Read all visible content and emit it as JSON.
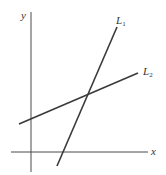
{
  "diagram": {
    "type": "coordinate-plane-two-lines",
    "axes": {
      "x_label": "x",
      "y_label": "y"
    },
    "lines": [
      {
        "name": "L1",
        "label_main": "L",
        "label_sub": "1",
        "slope_sign": "positive (steep)",
        "color": "#3a3a3a"
      },
      {
        "name": "L2",
        "label_main": "L",
        "label_sub": "2",
        "slope_sign": "positive (shallow)",
        "color": "#3a3a3a"
      }
    ],
    "intersection": "L1 and L2 intersect in the first quadrant"
  }
}
